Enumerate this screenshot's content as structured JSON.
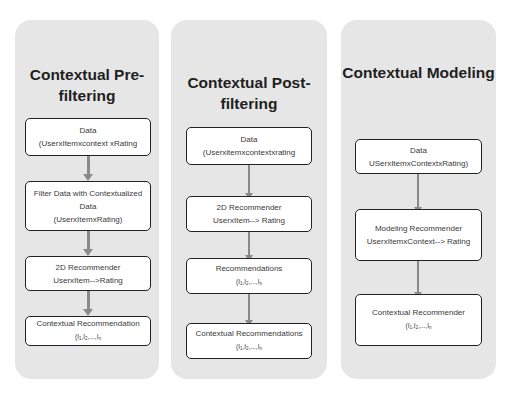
{
  "diagram": {
    "colors": {
      "panel_background": "#e6e6e6",
      "box_background": "#ffffff",
      "box_border": "#222222",
      "arrow": "#8a8a8a",
      "title_text": "#1f1f1f",
      "box_text": "#3a3a3a"
    },
    "panels": [
      {
        "title_line1": "Contextual Pre-",
        "title_line2": "filtering",
        "boxes": [
          {
            "line1": "Data",
            "line2": "(UserxItemxcontext xRating"
          },
          {
            "line1": "Filter Data with Contextualized",
            "line2": "Data",
            "line3": "(UserxItemxRating)"
          },
          {
            "line1": "2D Recommender",
            "line2": "UserxItem-->Rating"
          },
          {
            "line1": "Contextual Recommendation",
            "items": "(I1,I2,...,In"
          }
        ]
      },
      {
        "title_line1": "Contextual Post-",
        "title_line2": "filtering",
        "boxes": [
          {
            "line1": "Data",
            "line2": "(Userxitemxcontextxrating"
          },
          {
            "line1": "2D Recommender",
            "line2": "UserxItem--> Rating"
          },
          {
            "line1": "Recommendations",
            "items": "(I1,I2,...,In"
          },
          {
            "line1": "Contextual Recommendations",
            "items": "(I1,I2,...,In"
          }
        ]
      },
      {
        "title_line1": "Contextual Modeling",
        "boxes": [
          {
            "line1": "Data",
            "line2": "USerxItemxContextxRating)"
          },
          {
            "line1": "Modeling Recommender",
            "line2": "UserxItemxContext--> Rating"
          },
          {
            "line1": "Contextual Recommender",
            "items": "(I1,I2,...,In"
          }
        ]
      }
    ],
    "subscript": {
      "open": "(",
      "I": "I",
      "sep": ",",
      "ellipsis": "...,",
      "s1": "1",
      "s2": "2",
      "sn": "n"
    }
  }
}
